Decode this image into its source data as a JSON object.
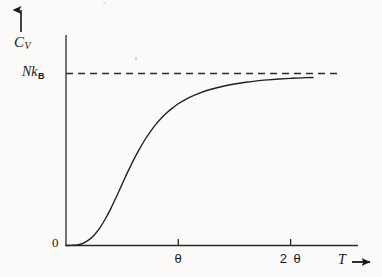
{
  "figure": {
    "title": "",
    "background_color": "#fbfaf9",
    "ink_color": "#1a1a1a"
  },
  "axes": {
    "y": {
      "label_main": "C",
      "label_sub": "V",
      "direction_arrow": "up-arrow-icon",
      "origin_label": "0"
    },
    "x": {
      "label_main": "T",
      "direction_arrow": "right-arrow-icon",
      "tick_labels": [
        "θ",
        "2 θ"
      ]
    }
  },
  "asymptote": {
    "label_main": "Nk",
    "label_sub": "B",
    "style": "dashed"
  },
  "chart_data": {
    "type": "line",
    "title": "",
    "xlabel": "T",
    "ylabel": "C_V",
    "grid": false,
    "legend": null,
    "xlim": [
      0,
      2.6
    ],
    "ylim": [
      0,
      1.08
    ],
    "x_tick_values": [
      1,
      2
    ],
    "x_tick_labels": [
      "θ",
      "2 θ"
    ],
    "y_tick_values": [
      0,
      1
    ],
    "y_tick_labels": [
      "0",
      "Nk_B"
    ],
    "annotations": [
      {
        "text": "Nk_B",
        "type": "horizontal-asymptote",
        "y": 1.0,
        "style": "dashed"
      }
    ],
    "series": [
      {
        "name": "Heat capacity C_V(T)",
        "style": "solid",
        "x": [
          0.0,
          0.05,
          0.1,
          0.15,
          0.2,
          0.25,
          0.3,
          0.35,
          0.4,
          0.45,
          0.5,
          0.55,
          0.6,
          0.65,
          0.7,
          0.75,
          0.8,
          0.85,
          0.9,
          0.95,
          1.0,
          1.1,
          1.2,
          1.3,
          1.4,
          1.5,
          1.6,
          1.7,
          1.8,
          1.9,
          2.0,
          2.1,
          2.2
        ],
        "y": [
          0.0,
          0.001,
          0.004,
          0.013,
          0.031,
          0.06,
          0.101,
          0.154,
          0.216,
          0.285,
          0.357,
          0.428,
          0.495,
          0.556,
          0.612,
          0.661,
          0.704,
          0.741,
          0.773,
          0.8,
          0.824,
          0.861,
          0.889,
          0.91,
          0.926,
          0.939,
          0.949,
          0.957,
          0.963,
          0.968,
          0.972,
          0.975,
          0.977
        ]
      }
    ]
  }
}
